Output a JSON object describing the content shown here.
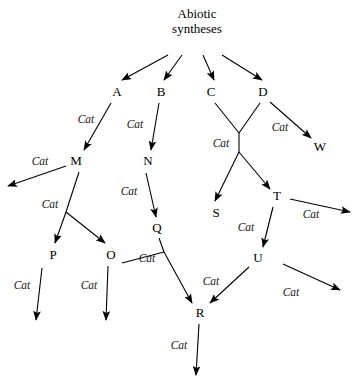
{
  "diagram": {
    "catalyst_label": "Cat",
    "stroke_color": "#000000",
    "background_color": "#ffffff",
    "root": {
      "id": "root",
      "line1": "Abiotic",
      "line2": "syntheses",
      "x": 197,
      "y": 22
    },
    "nodes": [
      {
        "id": "A",
        "label": "A",
        "x": 117,
        "y": 92
      },
      {
        "id": "B",
        "label": "B",
        "x": 161,
        "y": 92
      },
      {
        "id": "C",
        "label": "C",
        "x": 211,
        "y": 92
      },
      {
        "id": "D",
        "label": "D",
        "x": 263,
        "y": 92
      },
      {
        "id": "W",
        "label": "W",
        "x": 320,
        "y": 147
      },
      {
        "id": "M",
        "label": "M",
        "x": 76,
        "y": 161
      },
      {
        "id": "N",
        "label": "N",
        "x": 148,
        "y": 161
      },
      {
        "id": "S",
        "label": "S",
        "x": 216,
        "y": 213
      },
      {
        "id": "T",
        "label": "T",
        "x": 277,
        "y": 196
      },
      {
        "id": "Q",
        "label": "Q",
        "x": 157,
        "y": 228
      },
      {
        "id": "P",
        "label": "P",
        "x": 53,
        "y": 255
      },
      {
        "id": "O",
        "label": "O",
        "x": 111,
        "y": 255
      },
      {
        "id": "U",
        "label": "U",
        "x": 258,
        "y": 258
      },
      {
        "id": "R",
        "label": "R",
        "x": 200,
        "y": 313
      }
    ],
    "edges": [
      {
        "id": "root-to-A",
        "from": "root",
        "to": "A",
        "x1": 168,
        "y1": 55,
        "x2": 122,
        "y2": 80,
        "arrow": true,
        "label": null
      },
      {
        "id": "root-to-B",
        "from": "root",
        "to": "B",
        "x1": 182,
        "y1": 55,
        "x2": 164,
        "y2": 80,
        "arrow": true,
        "label": null
      },
      {
        "id": "root-to-C",
        "from": "root",
        "to": "C",
        "x1": 203,
        "y1": 55,
        "x2": 214,
        "y2": 80,
        "arrow": true,
        "label": null
      },
      {
        "id": "root-to-D",
        "from": "root",
        "to": "D",
        "x1": 222,
        "y1": 55,
        "x2": 262,
        "y2": 80,
        "arrow": true,
        "label": null
      },
      {
        "id": "A-to-M",
        "from": "A",
        "to": "M",
        "x1": 111,
        "y1": 103,
        "x2": 84,
        "y2": 150,
        "arrow": true,
        "label": "Cat",
        "lx": 86,
        "ly": 119
      },
      {
        "id": "B-to-N",
        "from": "B",
        "to": "N",
        "x1": 159,
        "y1": 103,
        "x2": 151,
        "y2": 150,
        "arrow": true,
        "label": "Cat",
        "lx": 135,
        "ly": 124
      },
      {
        "id": "C-to-X",
        "from": "C",
        "to": "junction",
        "x1": 215,
        "y1": 103,
        "x2": 239,
        "y2": 133,
        "arrow": false,
        "label": null
      },
      {
        "id": "D-to-X",
        "from": "D",
        "to": "junction",
        "x1": 260,
        "y1": 103,
        "x2": 239,
        "y2": 133,
        "arrow": false,
        "label": null
      },
      {
        "id": "X-stem",
        "from": "junction",
        "to": "junction2",
        "x1": 239,
        "y1": 133,
        "x2": 239,
        "y2": 152,
        "arrow": false,
        "label": "Cat",
        "lx": 221,
        "ly": 143
      },
      {
        "id": "X-to-S",
        "from": "junction2",
        "to": "S",
        "x1": 239,
        "y1": 152,
        "x2": 215,
        "y2": 201,
        "arrow": true,
        "label": null
      },
      {
        "id": "X-to-T",
        "from": "junction2",
        "to": "T",
        "x1": 239,
        "y1": 152,
        "x2": 270,
        "y2": 189,
        "arrow": true,
        "label": null
      },
      {
        "id": "D-to-W",
        "from": "D",
        "to": "W",
        "x1": 270,
        "y1": 102,
        "x2": 311,
        "y2": 138,
        "arrow": true,
        "label": "Cat",
        "lx": 280,
        "ly": 127
      },
      {
        "id": "M-to-left",
        "from": "M",
        "to": "offscreen-left",
        "x1": 66,
        "y1": 166,
        "x2": 8,
        "y2": 186,
        "arrow": true,
        "label": "Cat",
        "lx": 40,
        "ly": 161
      },
      {
        "id": "M-to-junction",
        "from": "M",
        "to": "mjunction",
        "x1": 79,
        "y1": 172,
        "x2": 66,
        "y2": 212,
        "arrow": false,
        "label": "Cat",
        "lx": 50,
        "ly": 204
      },
      {
        "id": "M-to-P",
        "from": "mjunction",
        "to": "P",
        "x1": 66,
        "y1": 212,
        "x2": 55,
        "y2": 243,
        "arrow": true,
        "label": null
      },
      {
        "id": "M-to-O",
        "from": "mjunction",
        "to": "O",
        "x1": 66,
        "y1": 212,
        "x2": 105,
        "y2": 243,
        "arrow": true,
        "label": null
      },
      {
        "id": "N-to-Q",
        "from": "N",
        "to": "Q",
        "x1": 146,
        "y1": 173,
        "x2": 156,
        "y2": 217,
        "arrow": true,
        "label": "Cat",
        "lx": 129,
        "ly": 191
      },
      {
        "id": "P-down",
        "from": "P",
        "to": "offscreen-down-p",
        "x1": 42,
        "y1": 268,
        "x2": 36,
        "y2": 320,
        "arrow": true,
        "label": "Cat",
        "lx": 22,
        "ly": 285
      },
      {
        "id": "O-down",
        "from": "O",
        "to": "offscreen-down-o",
        "x1": 108,
        "y1": 266,
        "x2": 106,
        "y2": 320,
        "arrow": true,
        "label": "Cat",
        "lx": 89,
        "ly": 285
      },
      {
        "id": "O-to-qjunction",
        "from": "O",
        "to": "qjunction",
        "x1": 122,
        "y1": 263,
        "x2": 164,
        "y2": 252,
        "arrow": false,
        "label": "Cat",
        "lx": 147,
        "ly": 258
      },
      {
        "id": "Q-to-qjunction",
        "from": "Q",
        "to": "qjunction",
        "x1": 159,
        "y1": 238,
        "x2": 164,
        "y2": 252,
        "arrow": false,
        "label": null
      },
      {
        "id": "qjunction-to-R",
        "from": "qjunction",
        "to": "R",
        "x1": 164,
        "y1": 252,
        "x2": 192,
        "y2": 303,
        "arrow": true,
        "label": null
      },
      {
        "id": "T-right",
        "from": "T",
        "to": "offscreen-right-t",
        "x1": 290,
        "y1": 199,
        "x2": 350,
        "y2": 212,
        "arrow": true,
        "label": "Cat",
        "lx": 311,
        "ly": 214
      },
      {
        "id": "T-to-U",
        "from": "T",
        "to": "U",
        "x1": 273,
        "y1": 207,
        "x2": 263,
        "y2": 247,
        "arrow": true,
        "label": "Cat",
        "lx": 246,
        "ly": 227
      },
      {
        "id": "U-right",
        "from": "U",
        "to": "offscreen-right-u",
        "x1": 283,
        "y1": 264,
        "x2": 340,
        "y2": 290,
        "arrow": true,
        "label": "Cat",
        "lx": 291,
        "ly": 292
      },
      {
        "id": "U-to-R",
        "from": "U",
        "to": "R",
        "x1": 249,
        "y1": 267,
        "x2": 210,
        "y2": 303,
        "arrow": true,
        "label": "Cat",
        "lx": 211,
        "ly": 281
      },
      {
        "id": "R-down",
        "from": "R",
        "to": "offscreen-down-r",
        "x1": 199,
        "y1": 324,
        "x2": 196,
        "y2": 375,
        "arrow": true,
        "label": "Cat",
        "lx": 179,
        "ly": 345
      }
    ]
  }
}
